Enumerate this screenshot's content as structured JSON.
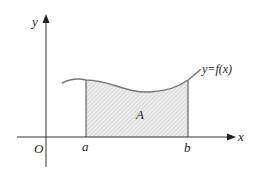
{
  "diagram": {
    "type": "definite-integral-area",
    "axes": {
      "x_label": "x",
      "y_label": "y",
      "origin_label": "O"
    },
    "bounds": {
      "lower_label": "a",
      "upper_label": "b"
    },
    "region_label": "A",
    "curve_label": "y=f(x)",
    "colors": {
      "line": "#333333",
      "curve": "#777777",
      "fill": "#e6e6e6",
      "hatch": "#bdbdbd"
    }
  }
}
